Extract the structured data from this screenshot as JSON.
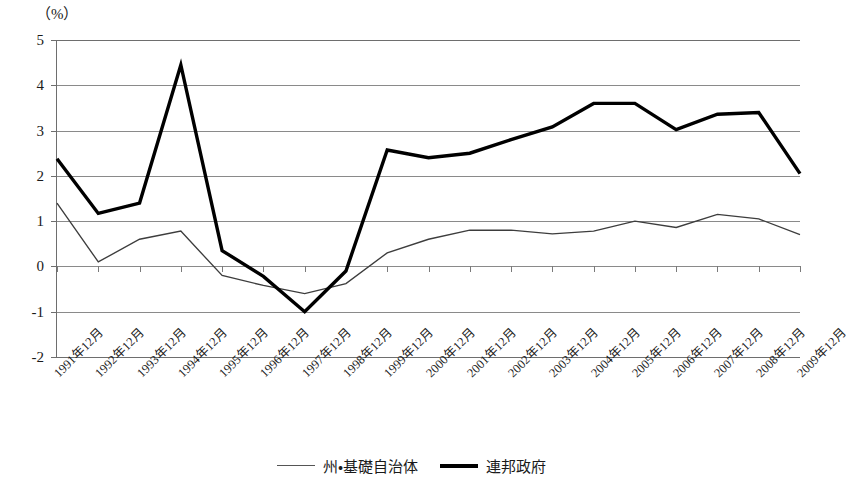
{
  "unit_label": "（%）",
  "chart_data": {
    "type": "line",
    "title": "",
    "subtitle": "",
    "xlabel": "",
    "ylabel": "（%）",
    "ylim": [
      -2,
      5
    ],
    "yticks": [
      5,
      4,
      3,
      2,
      1,
      0,
      -1,
      -2
    ],
    "ytick_labels": [
      "5",
      "4",
      "3",
      "2",
      "1",
      "0",
      "-1",
      "-2"
    ],
    "grid": true,
    "legend_position": "bottom",
    "categories": [
      "1991年12月",
      "1992年12月",
      "1993年12月",
      "1994年12月",
      "1995年12月",
      "1996年12月",
      "1997年12月",
      "1998年12月",
      "1999年12月",
      "2000年12月",
      "2001年12月",
      "2002年12月",
      "2003年12月",
      "2004年12月",
      "2005年12月",
      "2006年12月",
      "2007年12月",
      "2008年12月",
      "2009年12月"
    ],
    "series": [
      {
        "name": "州・基礎自治体",
        "style": "thin-gray",
        "color": "#3d3d3d",
        "values": [
          1.4,
          0.1,
          0.6,
          0.78,
          -0.2,
          -0.42,
          -0.6,
          -0.38,
          0.3,
          0.6,
          0.8,
          0.8,
          0.72,
          0.78,
          1.0,
          0.86,
          1.15,
          1.05,
          0.7
        ]
      },
      {
        "name": "連邦政府",
        "style": "thick-black",
        "color": "#000000",
        "values": [
          2.38,
          1.17,
          1.4,
          4.45,
          0.35,
          -0.22,
          -1.0,
          -0.1,
          2.57,
          2.4,
          2.5,
          2.8,
          3.08,
          3.6,
          3.6,
          3.02,
          3.36,
          3.4,
          2.05
        ]
      }
    ]
  },
  "legend": {
    "items": [
      {
        "label": "州・基礎自治体",
        "swatch": "thin-line-swatch"
      },
      {
        "label": "連邦政府",
        "swatch": "thick-line-swatch"
      }
    ]
  }
}
